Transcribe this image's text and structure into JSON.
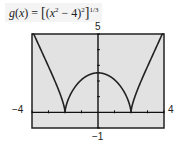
{
  "title": {
    "fn": "g",
    "var": "x",
    "expression_text": "g(x) = [(x² − 4)²]^(1/3)",
    "lhs": "g(x) = ",
    "inner": "(x² − 4)²",
    "exponent": "1/3"
  },
  "labels": {
    "ymax": "5",
    "ymin": "−1",
    "xmin": "−4",
    "xmax": "4"
  },
  "colors": {
    "plot_bg": "#e2e2e2",
    "frame": "#222222",
    "curve": "#222222",
    "axis": "#111111"
  },
  "chart_data": {
    "type": "line",
    "xlabel": "",
    "ylabel": "",
    "xlim": [
      -4,
      4
    ],
    "ylim": [
      -1,
      5
    ],
    "xticks_step": 1,
    "yticks_step": 1,
    "grid": false,
    "legend": null,
    "annotations": [
      "-4",
      "4",
      "5",
      "-1"
    ],
    "series": [
      {
        "name": "g(x)",
        "x": [
          -4,
          -3.5,
          -3,
          -2.5,
          -2,
          -1.5,
          -1,
          -0.5,
          0,
          0.5,
          1,
          1.5,
          2,
          2.5,
          3,
          3.5,
          4
        ],
        "values": [
          5.24,
          4.37,
          3.42,
          2.27,
          0,
          1.56,
          2.08,
          2.37,
          2.52,
          2.37,
          2.08,
          1.56,
          0,
          2.27,
          3.42,
          4.37,
          5.24
        ]
      }
    ]
  }
}
